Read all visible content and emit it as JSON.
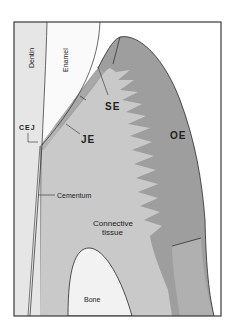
{
  "diagram": {
    "type": "anatomical cross-section",
    "colors": {
      "background": "#ffffff",
      "frame": "#3a3a3a",
      "dentin": "#e6e6e6",
      "enamel": "#fafafa",
      "connective_tissue": "#c9c9c9",
      "oral_epithelium": "#9e9e9e",
      "sulcular_epithelium": "#a8a8a8",
      "junctional_epithelium": "#b4b4b4",
      "bone": "#f2f2f2",
      "outline": "#2a2a2a"
    },
    "labels": {
      "dentin": "Dentin",
      "enamel": "Enamel",
      "se": "SE",
      "je": "JE",
      "oe": "OE",
      "cej": "CEJ",
      "cementum": "Cementum",
      "connective_line1": "Connective",
      "connective_line2": "tissue",
      "bone": "Bone"
    }
  }
}
